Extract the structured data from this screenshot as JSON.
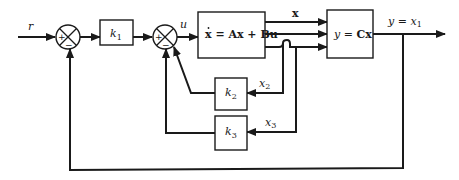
{
  "diagram": {
    "type": "state-feedback block diagram",
    "signals": {
      "reference": "r",
      "control": "u",
      "state": "x",
      "output": "y = x",
      "output_sub": "1",
      "state2": "x",
      "state2_sub": "2",
      "state3": "x",
      "state3_sub": "3"
    },
    "blocks": {
      "gain1": {
        "label": "k",
        "sub": "1"
      },
      "plant": {
        "label_pre": "x",
        "label_post": " = Ax + Bu"
      },
      "output_map": {
        "label_y": "y",
        "label_eq": " = ",
        "label_c": "Cx"
      },
      "gain2": {
        "label": "k",
        "sub": "2"
      },
      "gain3": {
        "label": "k",
        "sub": "3"
      }
    },
    "summing_junctions": [
      {
        "id": "sum1",
        "plus": "+",
        "minus": "−"
      },
      {
        "id": "sum2",
        "plus": "+",
        "minus": "−"
      }
    ],
    "colors": {
      "stroke": "#1a1a1a",
      "background": "#ffffff"
    }
  }
}
